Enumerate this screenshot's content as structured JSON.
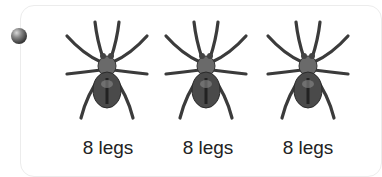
{
  "bullet": {
    "icon": "sphere-bullet-icon",
    "color": "#3a3a3a"
  },
  "items": [
    {
      "icon": "spider-icon",
      "label": "8 legs"
    },
    {
      "icon": "spider-icon",
      "label": "8 legs"
    },
    {
      "icon": "spider-icon",
      "label": "8 legs"
    }
  ]
}
